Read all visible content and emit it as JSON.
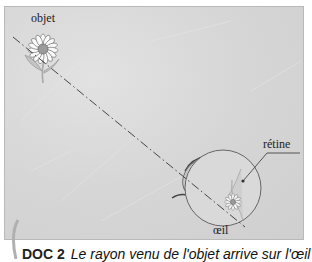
{
  "diagram": {
    "labels": {
      "object": "objet",
      "retina": "rétine",
      "eye": "œil"
    },
    "caption": {
      "doc": "DOC 2",
      "text": "Le rayon venu de l'objet arrive sur l'œil"
    },
    "colors": {
      "background": "#d6d6d6",
      "eye_fill": "#d9d9d9",
      "cornea_fill": "#c8c8c8",
      "ray": "#333333",
      "flower_center": "#9a9a9a",
      "stem": "#a8a8a8"
    },
    "elements": [
      {
        "name": "object-flower",
        "x": 42,
        "y": 48
      },
      {
        "name": "light-ray",
        "from": [
          12,
          36
        ],
        "to": [
          242,
          226
        ],
        "style": "dash-dot"
      },
      {
        "name": "eye",
        "cx": 222,
        "cy": 187,
        "r": 38
      },
      {
        "name": "retina-image-flower",
        "x": 232,
        "y": 201
      }
    ]
  }
}
